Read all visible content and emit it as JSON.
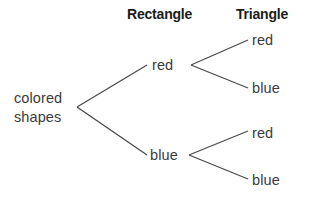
{
  "diagram": {
    "type": "probability-tree",
    "title_row": {
      "headers": [
        {
          "label": "Rectangle",
          "x": 127,
          "y": 6
        },
        {
          "label": "Triangle",
          "x": 236,
          "y": 6
        }
      ]
    },
    "root": {
      "line1": "colored",
      "line2": "shapes",
      "x": 14,
      "y": 89
    },
    "level1": [
      {
        "label": "red",
        "x": 152,
        "y": 56
      },
      {
        "label": "blue",
        "x": 150,
        "y": 146
      }
    ],
    "level2": [
      {
        "label": "red",
        "x": 252,
        "y": 31,
        "parent": "red"
      },
      {
        "label": "blue",
        "x": 252,
        "y": 79,
        "parent": "red"
      },
      {
        "label": "red",
        "x": 252,
        "y": 124,
        "parent": "blue"
      },
      {
        "label": "blue",
        "x": 252,
        "y": 171,
        "parent": "blue"
      }
    ],
    "edges": [
      {
        "name": "root-to-red",
        "x1": 77,
        "y1": 107,
        "x2": 147,
        "y2": 65
      },
      {
        "name": "root-to-blue",
        "x1": 77,
        "y1": 107,
        "x2": 147,
        "y2": 155
      },
      {
        "name": "red-to-red",
        "x1": 191,
        "y1": 65,
        "x2": 248,
        "y2": 40
      },
      {
        "name": "red-to-blue",
        "x1": 191,
        "y1": 65,
        "x2": 248,
        "y2": 88
      },
      {
        "name": "blue-to-red",
        "x1": 189,
        "y1": 155,
        "x2": 248,
        "y2": 131
      },
      {
        "name": "blue-to-blue",
        "x1": 189,
        "y1": 155,
        "x2": 248,
        "y2": 179
      }
    ],
    "colors": {
      "background": "#ffffff",
      "line": "#4a4a4a",
      "header_text": "#1c1c1c",
      "node_text": "#3b3b3b"
    }
  }
}
